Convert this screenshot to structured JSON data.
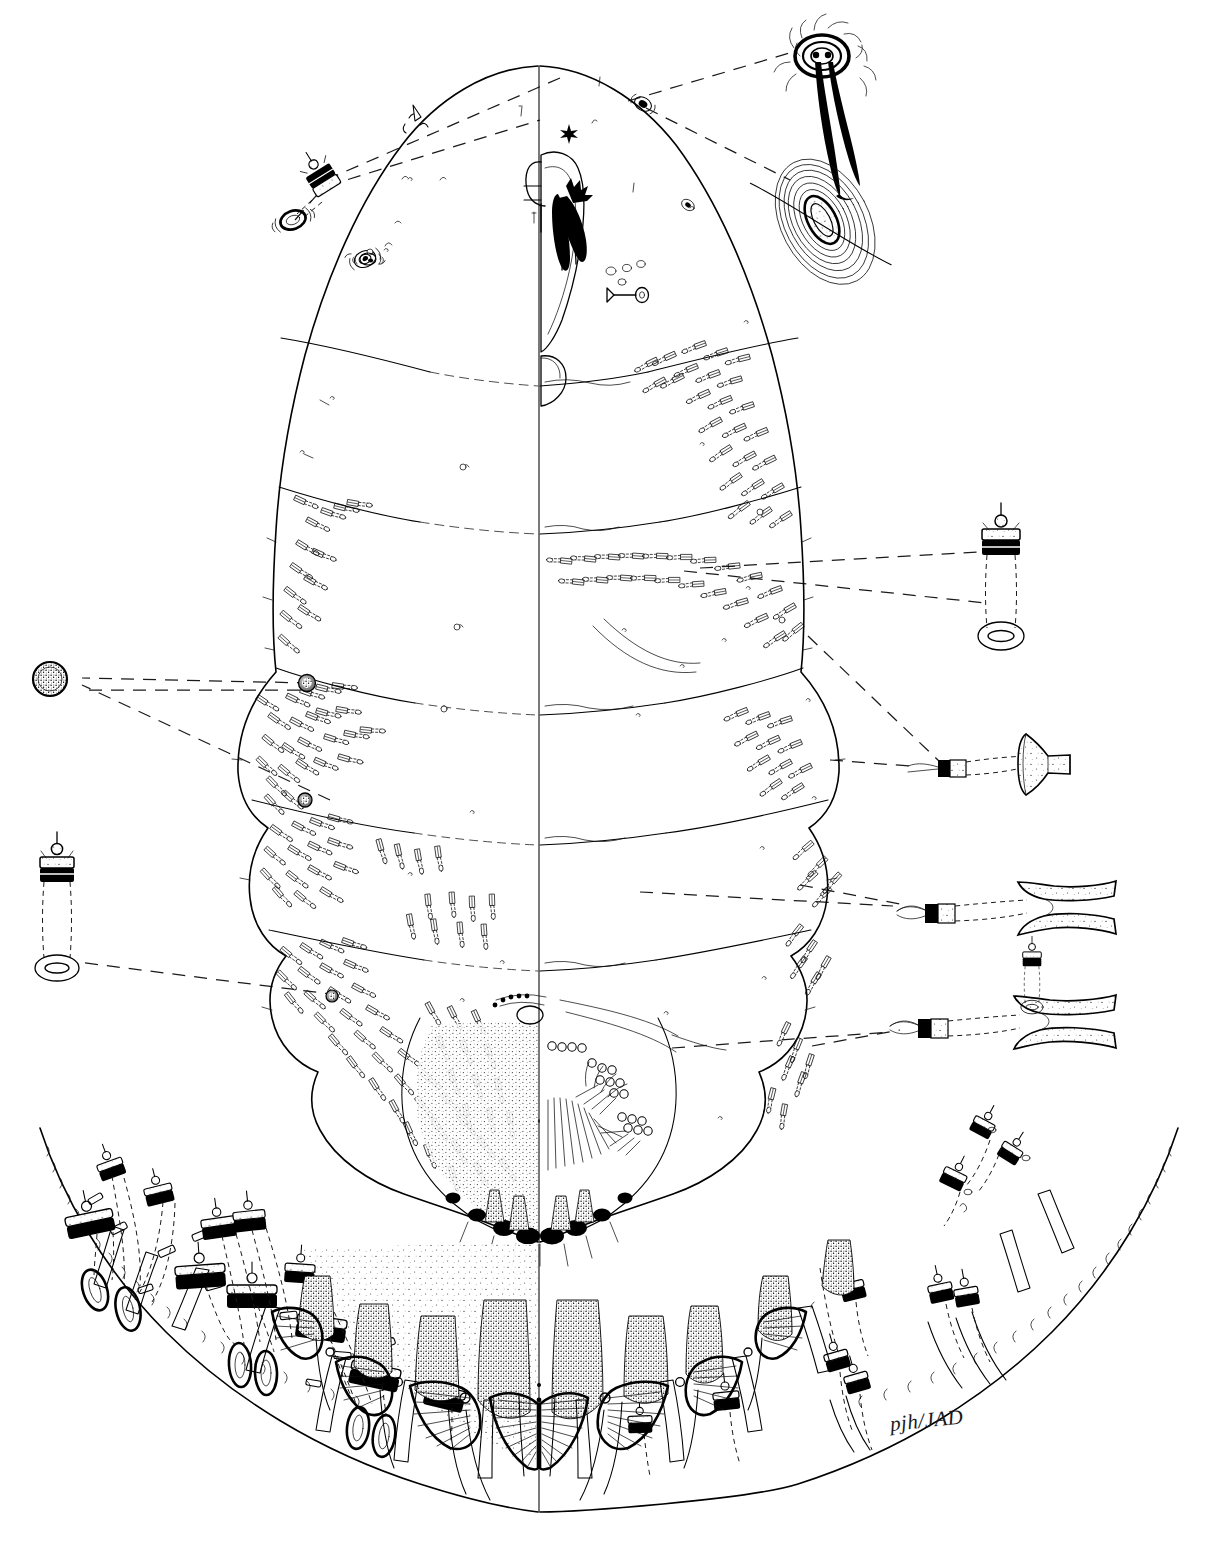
{
  "figure": {
    "kind": "scientific-line-illustration",
    "technique": "pen-and-ink stipple and line",
    "background_color": "#ffffff",
    "ink_color": "#000000",
    "view_split": "left half = dorsum, right half = venter, divided by body midline",
    "signature": "pjh/JAD",
    "has_caption_text": false,
    "has_scale_bar": false,
    "has_labels": false
  },
  "body": {
    "outline_name": "body-outline",
    "midline_name": "body-midline",
    "regions": [
      {
        "name": "head-region",
        "desc": "broadly rounded anterior apex with mouthparts"
      },
      {
        "name": "prosoma",
        "desc": "thorax with anterior and posterior spiracles"
      },
      {
        "name": "free-abdominal-segments",
        "desc": "lobed lateral segment margins bearing duct clusters"
      },
      {
        "name": "pygidium",
        "desc": "fused terminal abdominal plate bearing lobes, plates and pores"
      }
    ],
    "segment_count": 5,
    "margin_lobes_per_side": 5
  },
  "mouthparts": {
    "name": "mouthparts-cluster",
    "parts": [
      "clypeolabral shield",
      "labium",
      "stylet loop",
      "stylet bundle"
    ]
  },
  "structures": [
    {
      "name": "macroduct",
      "desc": "two-barred tubular duct with orifice and terminal gland"
    },
    {
      "name": "microduct",
      "desc": "small tubular duct scattered over derm"
    },
    {
      "name": "spiracle",
      "desc": "round stippled pore on thorax"
    },
    {
      "name": "perivulvar-pore",
      "desc": "multilocular disc pore in clustered groups"
    },
    {
      "name": "marginal-seta",
      "desc": "fine hair-like seta on body margin"
    },
    {
      "name": "pygidial-lobe",
      "desc": "sclerotized median and lateral lobes"
    },
    {
      "name": "gland-spine",
      "desc": "stippled conical spine between lobes"
    },
    {
      "name": "plate",
      "desc": "fringed fan-shaped plate between pygidial lobes"
    },
    {
      "name": "anus",
      "desc": "small oval opening on pygidium"
    },
    {
      "name": "vulva",
      "desc": "transverse slit on ventral pygidium"
    }
  ],
  "insets": [
    {
      "id": "inset-anterior-seta",
      "position": "top-right",
      "name": "enlarged-anterior-seta",
      "desc": "heavily inked basal socket with long flagellate setal shaft"
    },
    {
      "id": "inset-marginal-eye",
      "position": "upper-right-margin",
      "name": "enlarged-marginal-eye",
      "desc": "concentric ringed ocular sclerite on body margin"
    },
    {
      "id": "inset-anterior-spiracle",
      "position": "upper-left",
      "name": "enlarged-anterior-spiracle",
      "desc": "spiracular atrium with associated duct and pore"
    },
    {
      "id": "inset-macroduct-right",
      "position": "right-upper",
      "name": "enlarged-macroduct-dorsal",
      "desc": "two-barred macroduct: dark orifice bar, long tube, oval terminal gland"
    },
    {
      "id": "inset-macroduct-left",
      "position": "left-middle",
      "name": "enlarged-macroduct-ventral",
      "desc": "two-barred macroduct shown at same magnification"
    },
    {
      "id": "inset-disc-pore",
      "position": "left-upper",
      "name": "enlarged-perivulvar-pore",
      "desc": "stippled circular multilocular disc pore"
    },
    {
      "id": "inset-gland-spine",
      "position": "right-middle",
      "name": "enlarged-gland-spine",
      "desc": "short duct with flared stippled gland spine"
    },
    {
      "id": "inset-trumpet-duct-upper",
      "position": "right-lower",
      "name": "enlarged-trumpet-duct-upper",
      "desc": "elongate stippled trumpet-shaped marginal duct"
    },
    {
      "id": "inset-trumpet-duct-lower",
      "position": "right-lowest",
      "name": "enlarged-trumpet-duct-lower",
      "desc": "second elongate stippled trumpet-shaped marginal duct"
    },
    {
      "id": "inset-pygidium",
      "position": "bottom-full-width",
      "name": "enlarged-pygidium",
      "desc": "greatly enlarged pygidial margin showing median and lateral lobes, fringed plates, gland spines and macroducts with leader lines"
    }
  ]
}
